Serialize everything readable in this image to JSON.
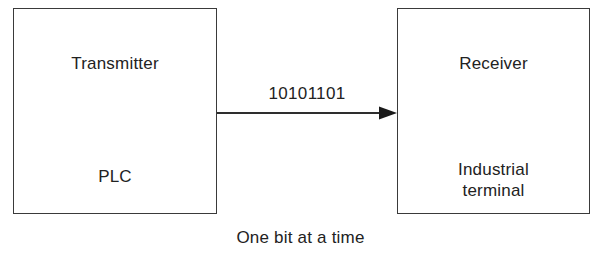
{
  "diagram": {
    "caption": "One bit at a time",
    "line_color": "#3a3a3a",
    "text_color": "#222222",
    "background_color": "#ffffff",
    "nodes": [
      {
        "id": "transmitter",
        "title": "Transmitter",
        "subtitle": "PLC"
      },
      {
        "id": "receiver",
        "title": "Receiver",
        "subtitle": "Industrial\nterminal"
      }
    ],
    "link": {
      "label": "10101101",
      "direction": "left-to-right",
      "arrowhead": "solid-triangle"
    }
  }
}
